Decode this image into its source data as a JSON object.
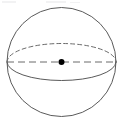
{
  "figure": {
    "name": "sphere-with-equator-and-center",
    "type": "geometry-diagram",
    "shape_label": "sphere",
    "caption": "",
    "width": 122,
    "height": 123,
    "background_color": "#ffffff",
    "stroke_color": "#5a5a5a",
    "dash_color": "#6b6b6b",
    "dot_color": "#000000",
    "stroke_width": 1,
    "elements": [
      {
        "name": "sphere-outline",
        "kind": "circle",
        "cx": 61.5,
        "cy": 62,
        "r": 54.5,
        "style": "solid",
        "fill": "none"
      },
      {
        "name": "equator-back-arc",
        "kind": "ellipse-arc",
        "cx": 61.5,
        "cy": 62,
        "rx": 54.5,
        "ry": 18.5,
        "half": "upper",
        "style": "dashed",
        "dash_pattern": "4,3"
      },
      {
        "name": "equator-front-arc",
        "kind": "ellipse-arc",
        "cx": 61.5,
        "cy": 62,
        "rx": 54.5,
        "ry": 18.5,
        "half": "lower",
        "style": "solid"
      },
      {
        "name": "horizontal-diameter",
        "kind": "line",
        "x1": 7,
        "y1": 62,
        "x2": 116,
        "y2": 62,
        "style": "dashed",
        "dash_pattern": "7,4"
      },
      {
        "name": "center-point",
        "kind": "dot",
        "cx": 61.5,
        "cy": 62,
        "r": 3,
        "fill": "#000000"
      }
    ],
    "scan_artifacts": [
      {
        "name": "scan-speck-left",
        "x": 2,
        "y": 1,
        "w": 14,
        "h": 2
      },
      {
        "name": "scan-speck-mid",
        "x": 46,
        "y": 1,
        "w": 20,
        "h": 2
      },
      {
        "name": "scan-speck-right",
        "x": 70,
        "y": 2,
        "w": 10,
        "h": 1
      }
    ]
  }
}
